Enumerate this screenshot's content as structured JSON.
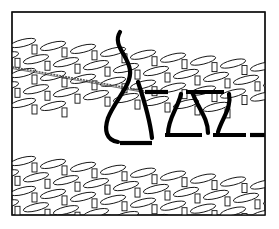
{
  "figure": {
    "title": "",
    "caption": "",
    "colors": {
      "ink": "#000000",
      "paper": "#ffffff"
    },
    "frame": {
      "x": 12,
      "y": 12,
      "w": 253,
      "h": 203
    },
    "upper_fabric": {
      "rows": 6,
      "row_spacing": 15,
      "start_y": 22,
      "stitch_w": 26,
      "stitch_h": 7,
      "slope": -0.28
    },
    "lower_fabric": {
      "rows": 6,
      "row_spacing": 15,
      "start_y": 140,
      "stitch_w": 26,
      "stitch_h": 7,
      "slope": -0.28
    },
    "needle": {
      "from": [
        12,
        67
      ],
      "to": [
        150,
        92
      ]
    },
    "yarn": {
      "main_path": "M120 32 C 112 45, 128 55, 130 70 C 132 85, 115 100, 108 118 C 104 130, 106 140, 118 142",
      "right_leg": "M138 82 C 144 100, 150 120, 152 138",
      "s_curves": [
        "M181 94 C 178 108, 168 118, 168 134",
        "M193 94 C 198 108, 208 118, 208 133",
        "M229 94 C 232 108, 222 118, 218 132"
      ],
      "upper_dashes": [
        [
          145,
          92,
          168,
          92
        ],
        [
          186,
          92,
          224,
          92
        ]
      ],
      "lower_dashes": [
        [
          120,
          143,
          152,
          143
        ],
        [
          165,
          135,
          202,
          135
        ],
        [
          213,
          135,
          246,
          135
        ],
        [
          250,
          135,
          265,
          135
        ]
      ]
    }
  }
}
